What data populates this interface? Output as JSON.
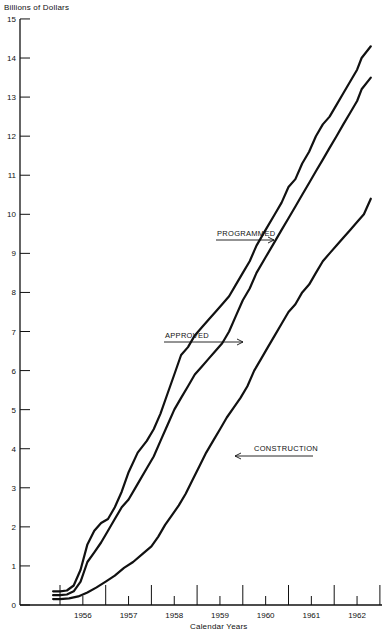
{
  "chart_data": {
    "type": "line",
    "title": "",
    "ylabel": "Billions of Dollars",
    "xlabel": "Calendar Years",
    "ylim": [
      0,
      15
    ],
    "xlim": [
      1955.85,
      1963.0
    ],
    "yticks": [
      0,
      1,
      2,
      3,
      4,
      5,
      6,
      7,
      8,
      9,
      10,
      11,
      12,
      13,
      14,
      15
    ],
    "xtick_labels": [
      "1956",
      "1957",
      "1958",
      "1959",
      "1960",
      "1961",
      "1962"
    ],
    "grid": false,
    "legend": "inline annotations with arrows",
    "series": [
      {
        "name": "PROGRAMMED",
        "x": [
          1955.85,
          1956.0,
          1956.15,
          1956.3,
          1956.45,
          1956.6,
          1956.75,
          1956.9,
          1957.05,
          1957.2,
          1957.35,
          1957.5,
          1957.7,
          1957.9,
          1958.05,
          1958.2,
          1958.35,
          1958.5,
          1958.65,
          1958.8,
          1958.95,
          1959.1,
          1959.25,
          1959.4,
          1959.55,
          1959.7,
          1959.85,
          1960.0,
          1960.15,
          1960.3,
          1960.5,
          1960.7,
          1960.85,
          1961.0,
          1961.15,
          1961.3,
          1961.45,
          1961.6,
          1961.75,
          1961.9,
          1962.05,
          1962.2,
          1962.35,
          1962.5,
          1962.6,
          1962.8
        ],
        "values": [
          0.35,
          0.35,
          0.37,
          0.5,
          0.9,
          1.55,
          1.9,
          2.1,
          2.2,
          2.5,
          2.9,
          3.4,
          3.9,
          4.2,
          4.5,
          4.9,
          5.4,
          5.9,
          6.4,
          6.6,
          6.9,
          7.1,
          7.3,
          7.5,
          7.7,
          7.9,
          8.2,
          8.5,
          8.8,
          9.2,
          9.6,
          10.0,
          10.3,
          10.7,
          10.9,
          11.3,
          11.6,
          12.0,
          12.3,
          12.5,
          12.8,
          13.1,
          13.4,
          13.7,
          14.0,
          14.3
        ]
      },
      {
        "name": "APPROVED",
        "x": [
          1955.85,
          1956.0,
          1956.15,
          1956.3,
          1956.45,
          1956.6,
          1956.75,
          1956.9,
          1957.05,
          1957.2,
          1957.35,
          1957.5,
          1957.7,
          1957.9,
          1958.05,
          1958.2,
          1958.35,
          1958.5,
          1958.65,
          1958.8,
          1958.95,
          1959.1,
          1959.25,
          1959.4,
          1959.55,
          1959.7,
          1959.85,
          1960.0,
          1960.15,
          1960.3,
          1960.5,
          1960.7,
          1960.85,
          1961.0,
          1961.15,
          1961.3,
          1961.45,
          1961.6,
          1961.75,
          1961.9,
          1962.05,
          1962.2,
          1962.35,
          1962.5,
          1962.6,
          1962.8
        ],
        "values": [
          0.25,
          0.25,
          0.27,
          0.35,
          0.6,
          1.1,
          1.35,
          1.6,
          1.9,
          2.2,
          2.5,
          2.7,
          3.1,
          3.5,
          3.8,
          4.2,
          4.6,
          5.0,
          5.3,
          5.6,
          5.9,
          6.1,
          6.3,
          6.5,
          6.7,
          7.0,
          7.4,
          7.8,
          8.1,
          8.5,
          8.9,
          9.3,
          9.6,
          9.9,
          10.2,
          10.5,
          10.8,
          11.1,
          11.4,
          11.7,
          12.0,
          12.3,
          12.6,
          12.9,
          13.2,
          13.5
        ]
      },
      {
        "name": "CONSTRUCTION",
        "x": [
          1955.85,
          1956.0,
          1956.2,
          1956.4,
          1956.6,
          1956.8,
          1957.0,
          1957.2,
          1957.4,
          1957.6,
          1957.8,
          1958.0,
          1958.15,
          1958.3,
          1958.45,
          1958.6,
          1958.75,
          1958.9,
          1959.05,
          1959.2,
          1959.35,
          1959.5,
          1959.65,
          1959.8,
          1959.95,
          1960.1,
          1960.25,
          1960.4,
          1960.55,
          1960.7,
          1960.85,
          1961.0,
          1961.15,
          1961.3,
          1961.45,
          1961.6,
          1961.75,
          1961.9,
          1962.05,
          1962.2,
          1962.35,
          1962.5,
          1962.65,
          1962.8
        ],
        "values": [
          0.15,
          0.15,
          0.17,
          0.22,
          0.32,
          0.45,
          0.6,
          0.75,
          0.95,
          1.1,
          1.3,
          1.5,
          1.75,
          2.05,
          2.3,
          2.55,
          2.85,
          3.2,
          3.55,
          3.9,
          4.2,
          4.5,
          4.8,
          5.05,
          5.3,
          5.6,
          6.0,
          6.3,
          6.6,
          6.9,
          7.2,
          7.5,
          7.7,
          8.0,
          8.2,
          8.5,
          8.8,
          9.0,
          9.2,
          9.4,
          9.6,
          9.8,
          10.0,
          10.4
        ]
      }
    ],
    "annotations": [
      {
        "text": "PROGRAMMED",
        "arrow_to_series": "PROGRAMMED"
      },
      {
        "text": "APPROVED",
        "arrow_to_series": "APPROVED"
      },
      {
        "text": "CONSTRUCTION",
        "arrow_to_series": "CONSTRUCTION"
      }
    ]
  },
  "labels": {
    "ylabel": "Billions of Dollars",
    "xlabel": "Calendar Years",
    "programmed": "PROGRAMMED",
    "approved": "APPROVED",
    "construction": "CONSTRUCTION"
  }
}
